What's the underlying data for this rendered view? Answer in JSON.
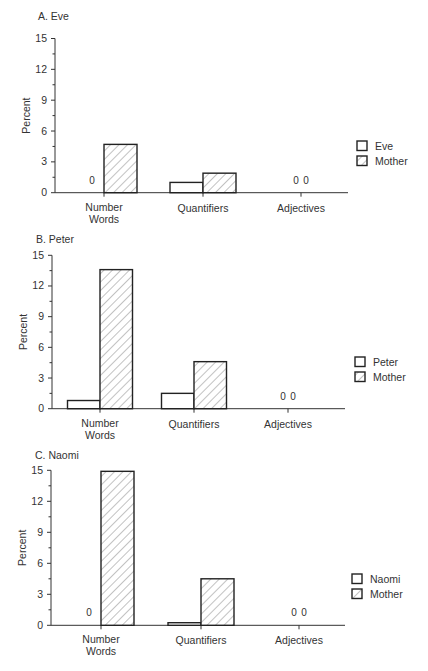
{
  "chart_data": [
    {
      "type": "bar",
      "title": "A. Eve",
      "xlabel": "",
      "ylabel": "Percent",
      "ylim": [
        0,
        15
      ],
      "yticks": [
        0,
        3,
        6,
        9,
        12,
        15
      ],
      "grid": false,
      "legend_position": "right",
      "categories": [
        "Number Words",
        "Quantifiers",
        "Adjectives"
      ],
      "series": [
        {
          "name": "Eve",
          "style": "open",
          "values": [
            0,
            1.0,
            0
          ]
        },
        {
          "name": "Mother",
          "style": "hatched",
          "values": [
            4.7,
            1.9,
            0
          ]
        }
      ],
      "annotations": [
        {
          "category": "Number Words",
          "series": "Eve",
          "text": "0"
        },
        {
          "category": "Adjectives",
          "series": "Eve",
          "text": "0"
        },
        {
          "category": "Adjectives",
          "series": "Mother",
          "text": "0"
        }
      ]
    },
    {
      "type": "bar",
      "title": "B. Peter",
      "xlabel": "",
      "ylabel": "Percent",
      "ylim": [
        0,
        15
      ],
      "yticks": [
        0,
        3,
        6,
        9,
        12,
        15
      ],
      "grid": false,
      "legend_position": "right",
      "categories": [
        "Number Words",
        "Quantifiers",
        "Adjectives"
      ],
      "series": [
        {
          "name": "Peter",
          "style": "open",
          "values": [
            0.8,
            1.5,
            0
          ]
        },
        {
          "name": "Mother",
          "style": "hatched",
          "values": [
            13.6,
            4.6,
            0
          ]
        }
      ],
      "annotations": [
        {
          "category": "Adjectives",
          "series": "Peter",
          "text": "0"
        },
        {
          "category": "Adjectives",
          "series": "Mother",
          "text": "0"
        }
      ]
    },
    {
      "type": "bar",
      "title": "C. Naomi",
      "xlabel": "",
      "ylabel": "Percent",
      "ylim": [
        0,
        15
      ],
      "yticks": [
        0,
        3,
        6,
        9,
        12,
        15
      ],
      "grid": false,
      "legend_position": "right",
      "categories": [
        "Number Words",
        "Quantifiers",
        "Adjectives"
      ],
      "series": [
        {
          "name": "Naomi",
          "style": "open",
          "values": [
            0,
            0.25,
            0
          ]
        },
        {
          "name": "Mother",
          "style": "hatched",
          "values": [
            14.9,
            4.5,
            0
          ]
        }
      ],
      "annotations": [
        {
          "category": "Number Words",
          "series": "Naomi",
          "text": "0"
        },
        {
          "category": "Adjectives",
          "series": "Naomi",
          "text": "0"
        },
        {
          "category": "Adjectives",
          "series": "Mother",
          "text": "0"
        }
      ]
    }
  ],
  "labels": {
    "ylabel": "Percent",
    "zero": "0",
    "cat_nw_line1": "Number",
    "cat_nw_line2": "Words",
    "cat_q": "Quantifiers",
    "cat_adj": "Adjectives",
    "ticks": [
      "0",
      "3",
      "6",
      "9",
      "12",
      "15"
    ]
  }
}
